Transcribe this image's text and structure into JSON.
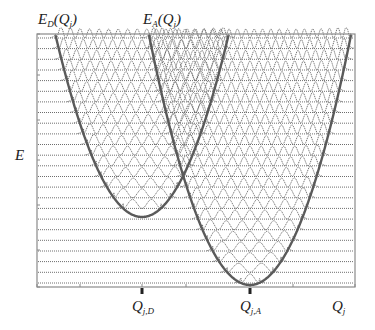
{
  "figure": {
    "type": "potential-energy-surfaces-with-vibrational-wavefunctions",
    "colors": {
      "frame": "#8a8a8a",
      "baseline": "#6e6e6e",
      "wave": "#707070",
      "parabola": "#5a5a5a",
      "text": "#222222"
    }
  },
  "labels": {
    "donor_curve": {
      "main": "E",
      "sub": "D",
      "arg": "(Q",
      "argsub": "j",
      "close": ")"
    },
    "acceptor_curve": {
      "main": "E",
      "sub": "A",
      "arg": "(Q",
      "argsub": "j",
      "close": ")"
    },
    "y_axis": "E",
    "x_axis": {
      "main": "Q",
      "sub": "j"
    },
    "donor_min": {
      "main": "Q",
      "sub": "j,D"
    },
    "acceptor_min": {
      "main": "Q",
      "sub": "j,A"
    }
  },
  "geometry": {
    "frame": {
      "x0": 37,
      "y0": 34,
      "x1": 355,
      "y1": 287
    },
    "donor_parabola": {
      "vx": 142,
      "vy": 217,
      "k": 0.0243
    },
    "acceptor_parabola": {
      "vx": 250,
      "vy": 285,
      "k": 0.0245
    },
    "levels": {
      "start_y": 38,
      "spacing": 10.65,
      "count": 24
    },
    "ticks_bottom": [
      37,
      80,
      142,
      186,
      250,
      293,
      355
    ],
    "ticks_left": [
      34,
      75,
      120,
      160,
      205,
      250,
      287
    ]
  }
}
